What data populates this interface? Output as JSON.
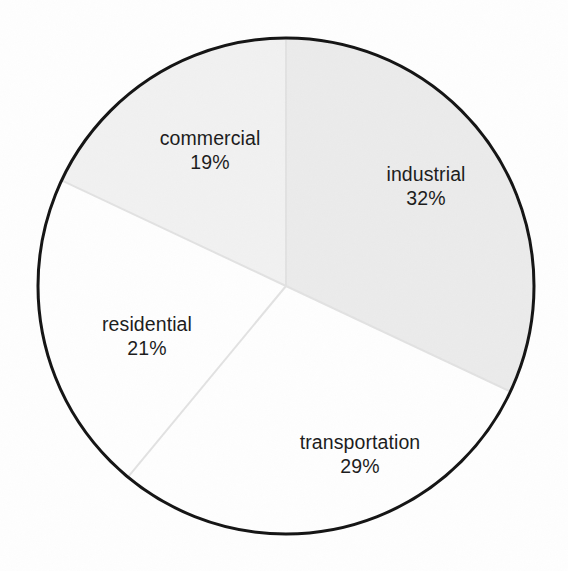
{
  "chart_data": {
    "type": "pie",
    "title": "",
    "subtitle": "",
    "xlabel": "",
    "ylabel": "",
    "legend_position": "none",
    "grid": false,
    "units": "percent",
    "total": 101,
    "start_angle_deg": 0,
    "direction": "clockwise",
    "categories": [
      "industrial",
      "transportation",
      "residential",
      "commercial"
    ],
    "values": [
      32,
      29,
      21,
      19
    ],
    "slices": [
      {
        "label": "industrial",
        "value": 32,
        "value_text": "32%",
        "color": "#ebebeb",
        "start_deg": 0,
        "end_deg": 115.2,
        "label_x": 426,
        "label_y": 187
      },
      {
        "label": "transportation",
        "value": 29,
        "value_text": "29%",
        "color": "#fefefe",
        "start_deg": 115.2,
        "end_deg": 219.6,
        "label_x": 360,
        "label_y": 455
      },
      {
        "label": "residential",
        "value": 21,
        "value_text": "21%",
        "color": "#fefefe",
        "start_deg": 219.6,
        "end_deg": 295.2,
        "label_x": 147,
        "label_y": 337
      },
      {
        "label": "commercial",
        "value": 19,
        "value_text": "19%",
        "color": "#f1f1f1",
        "start_deg": 295.2,
        "end_deg": 360,
        "label_x": 210,
        "label_y": 151
      }
    ],
    "geometry": {
      "center_x": 286,
      "center_y": 286,
      "radius": 248,
      "stroke_color": "#141414",
      "stroke_width": 3,
      "divider_color": "#e2e2e2",
      "background": "#fefefe"
    }
  }
}
